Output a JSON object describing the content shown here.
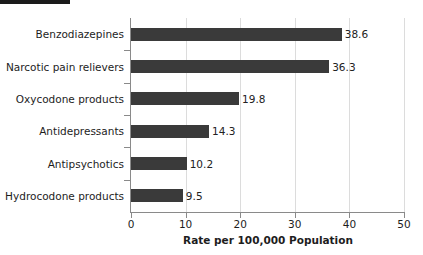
{
  "chart_data": {
    "type": "bar",
    "orientation": "horizontal",
    "title": "",
    "subtitle": "",
    "xlabel": "Rate per 100,000 Population",
    "ylabel": "",
    "xlim": [
      0,
      50
    ],
    "xticks": [
      0,
      10,
      20,
      30,
      40,
      50
    ],
    "xtick_labels": [
      "0",
      "10",
      "20",
      "30",
      "40",
      "50"
    ],
    "grid": true,
    "grid_axis": "x",
    "legend": false,
    "legend_position": "none",
    "bar_color": "#3a3a3a",
    "categories": [
      "Benzodiazepines",
      "Narcotic pain relievers",
      "Oxycodone products",
      "Antidepressants",
      "Antipsychotics",
      "Hydrocodone products"
    ],
    "values": [
      38.6,
      36.3,
      19.8,
      14.3,
      10.2,
      9.5
    ],
    "value_labels": [
      "38.6",
      "36.3",
      "19.8",
      "14.3",
      "10.2",
      "9.5"
    ]
  },
  "colors": {
    "bar": "#3a3a3a",
    "axis": "#8a8a8a",
    "grid": "#dcdcdc",
    "text": "#1d1d1d",
    "artifact": "#1b1b1b"
  }
}
